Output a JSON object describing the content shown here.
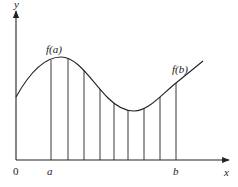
{
  "diagram": {
    "labels": {
      "y_axis": "y",
      "x_axis": "x",
      "origin": "0",
      "a": "a",
      "b": "b",
      "fa": "f(a)",
      "fb": "f(b)"
    },
    "colors": {
      "stroke": "#222222",
      "background": "#ffffff"
    },
    "axis": {
      "origin": [
        16,
        160
      ],
      "x_end": 229,
      "y_end": 11
    },
    "partition_x": [
      51,
      68,
      84,
      100,
      114,
      128,
      144,
      160,
      176
    ]
  }
}
